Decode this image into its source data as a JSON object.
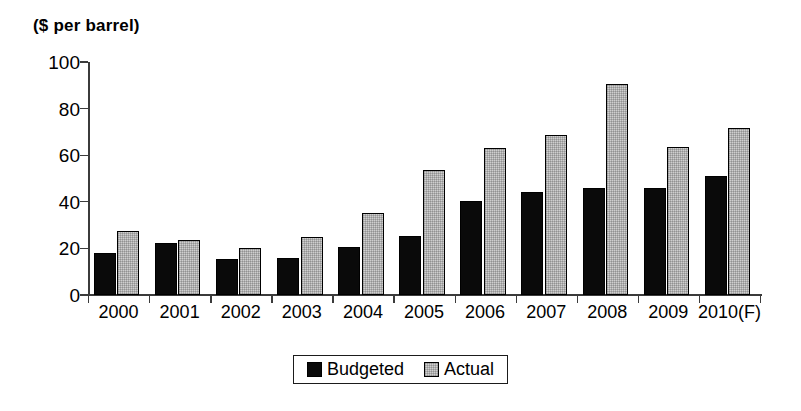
{
  "chart_data": {
    "type": "bar",
    "title": "($ per barrel)",
    "subtitle": "",
    "xlabel": "",
    "ylabel": "",
    "ylim": [
      0,
      100
    ],
    "yticks": [
      0,
      20,
      40,
      60,
      80,
      100
    ],
    "grid": false,
    "legend_position": "bottom-center",
    "categories": [
      "2000",
      "2001",
      "2002",
      "2003",
      "2004",
      "2005",
      "2006",
      "2007",
      "2008",
      "2009",
      "2010(F)"
    ],
    "series": [
      {
        "name": "Budgeted",
        "color": "#0a0a0a",
        "values": [
          18,
          22.5,
          15.5,
          16,
          20.5,
          25.5,
          40.5,
          44,
          46,
          46,
          51
        ]
      },
      {
        "name": "Actual",
        "color": "#cfcfcf",
        "values": [
          27.5,
          23.5,
          20,
          25,
          35,
          53.5,
          63,
          68.5,
          90.5,
          63.5,
          71.5
        ]
      }
    ]
  },
  "legend": {
    "entries": [
      {
        "label": "Budgeted",
        "swatch": "budgeted"
      },
      {
        "label": "Actual",
        "swatch": "actual"
      }
    ]
  },
  "colors": {
    "axis": "#3b3b3b",
    "budgeted": "#0a0a0a",
    "actual": "#cfcfcf",
    "outline": "#000000",
    "background": "#ffffff"
  }
}
